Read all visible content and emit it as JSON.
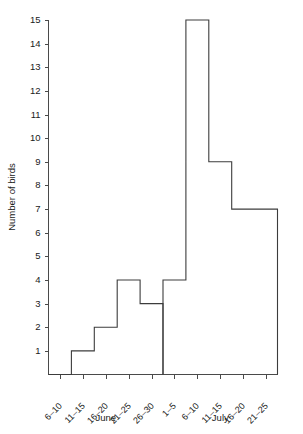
{
  "chart_data": {
    "type": "bar",
    "title": "",
    "subtitle": "",
    "xlabel": "",
    "ylabel": "Number of birds",
    "ylim": [
      0,
      15
    ],
    "yticks": [
      1,
      2,
      3,
      4,
      5,
      6,
      7,
      8,
      9,
      10,
      11,
      12,
      13,
      14,
      15
    ],
    "ytick_labels": [
      "1",
      "2",
      "3",
      "4",
      "5",
      "6",
      "7",
      "8",
      "9",
      "10",
      "11",
      "12",
      "13",
      "14",
      "15"
    ],
    "grid": false,
    "legend": null,
    "groups": [
      {
        "name": "June",
        "categories": [
          "6–10",
          "11–15",
          "16–20",
          "21–25",
          "26–30"
        ],
        "values": [
          0,
          1,
          2,
          4,
          3
        ]
      },
      {
        "name": "July",
        "categories": [
          "1–5",
          "6–10",
          "11–15",
          "16–20",
          "21–25"
        ],
        "values": [
          4,
          15,
          9,
          7,
          7
        ]
      }
    ],
    "categories": [
      "6–10",
      "11–15",
      "16–20",
      "21–25",
      "26–30",
      "1–5",
      "6–10",
      "11–15",
      "16–20",
      "21–25"
    ],
    "values": [
      0,
      1,
      2,
      4,
      3,
      4,
      15,
      9,
      7,
      7
    ],
    "colors": {
      "outline": "#3c3c3c",
      "axis": "#4a4a4a",
      "background": "#ffffff",
      "text": "#1a1a1a"
    }
  }
}
